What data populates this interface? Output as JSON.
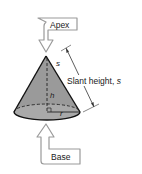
{
  "diagram": {
    "callouts": {
      "apex": "Apex",
      "base": "Base"
    },
    "labels": {
      "slant_on_side": "s",
      "height": "h",
      "radius": "r",
      "slant_height": "Slant height, s"
    },
    "colors": {
      "cone_fill": "#9a9a9a",
      "cone_base_fill": "#a8a8a8",
      "outline": "#111111",
      "callout_stroke": "#9a9a9a",
      "text": "#1a1a1a"
    }
  }
}
